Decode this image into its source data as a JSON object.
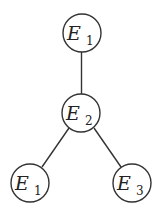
{
  "diagram": {
    "type": "tree",
    "nodes": [
      {
        "id": "n1",
        "base": "E",
        "subscript": "1",
        "cx": 82,
        "cy": 33,
        "r": 19
      },
      {
        "id": "n2",
        "base": "E",
        "subscript": "2",
        "cx": 81,
        "cy": 113,
        "r": 19
      },
      {
        "id": "n3",
        "base": "E",
        "subscript": "1",
        "cx": 30,
        "cy": 183,
        "r": 19
      },
      {
        "id": "n4",
        "base": "E",
        "subscript": "3",
        "cx": 132,
        "cy": 183,
        "r": 19
      }
    ],
    "edges": [
      {
        "from": "n1",
        "to": "n2"
      },
      {
        "from": "n2",
        "to": "n3"
      },
      {
        "from": "n2",
        "to": "n4"
      }
    ]
  }
}
